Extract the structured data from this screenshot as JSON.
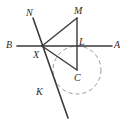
{
  "figure": {
    "background_color": "#ffffff",
    "stroke_color": "#2f2f2f",
    "circle_color": "#8e8e8e",
    "label_color": "#2b2b2b",
    "width": 131,
    "height": 123
  },
  "points": [
    {
      "id": "B",
      "label": "B",
      "x": 17,
      "y": 46,
      "label_x": 6,
      "label_y": 40
    },
    {
      "id": "A",
      "label": "A",
      "x": 112,
      "y": 46,
      "label_x": 114,
      "label_y": 40
    },
    {
      "id": "N",
      "label": "N",
      "x": 33,
      "y": 19,
      "label_x": 26,
      "label_y": 8
    },
    {
      "id": "K",
      "label": "K",
      "x": 59,
      "y": 92,
      "label_x": 36,
      "label_y": 87
    },
    {
      "id": "X",
      "label": "X",
      "x": 42,
      "y": 46,
      "label_x": 33,
      "label_y": 50
    },
    {
      "id": "L",
      "label": "L",
      "x": 77,
      "y": 46,
      "label_x": 79,
      "label_y": 37
    },
    {
      "id": "M",
      "label": "M",
      "x": 77,
      "y": 18,
      "label_x": 74,
      "label_y": 6
    },
    {
      "id": "C",
      "label": "C",
      "x": 77,
      "y": 70,
      "label_x": 74,
      "label_y": 73
    }
  ],
  "segments": [
    {
      "id": "BA",
      "name": "line-b-a",
      "from": "B",
      "to": "A",
      "style": "solid"
    },
    {
      "id": "NK",
      "name": "line-n-k",
      "from": "N",
      "to": "Kend",
      "style": "solid"
    },
    {
      "id": "XM",
      "name": "segment-x-m",
      "from": "X",
      "to": "M",
      "style": "solid"
    },
    {
      "id": "ML",
      "name": "segment-m-l",
      "from": "M",
      "to": "L",
      "style": "solid"
    },
    {
      "id": "LC",
      "name": "segment-l-c",
      "from": "L",
      "to": "C",
      "style": "solid"
    },
    {
      "id": "XC",
      "name": "segment-x-c",
      "from": "X",
      "to": "C",
      "style": "solid"
    },
    {
      "id": "XL",
      "name": "segment-x-l",
      "from": "X",
      "to": "L",
      "style": "solid"
    }
  ],
  "line_nk": {
    "x1": 33,
    "y1": 18,
    "x2": 68,
    "y2": 118
  },
  "circle": {
    "name": "dashed-circle",
    "center_label": "C",
    "cx": 77,
    "cy": 70,
    "r": 24,
    "style": "dashed"
  }
}
